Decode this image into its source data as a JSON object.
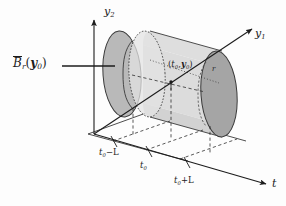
{
  "figure": {
    "kind": "3d-cylinder-diagram",
    "background_color": "#fdfdfd",
    "ink_color": "#1c1c1c"
  },
  "axes": {
    "vertical": {
      "name": "y2-axis",
      "label_base": "y",
      "label_sub": "2"
    },
    "depth": {
      "name": "y1-axis",
      "label_base": "y",
      "label_sub": "1"
    },
    "horizontal": {
      "name": "t-axis",
      "label_base": "t",
      "label_sub": ""
    }
  },
  "ticks": [
    {
      "label_lead": "t",
      "label_sub": "0",
      "label_tail": "−L"
    },
    {
      "label_lead": "t",
      "label_sub": "0",
      "label_tail": ""
    },
    {
      "label_lead": "t",
      "label_sub": "0",
      "label_tail": "+L"
    }
  ],
  "annotations": {
    "ball_label": {
      "overline_base": "B",
      "overline_sub": "r",
      "arg_open": "(",
      "arg_y": "y",
      "arg_sub": "0",
      "arg_close": ")"
    },
    "center_point": {
      "open": "(",
      "t": "t",
      "t_sub": "0",
      "comma": ",",
      "y": "y",
      "y_sub": "0",
      "close": ")"
    },
    "radius": "r"
  },
  "colors": {
    "left_disk_fill": "#b9b9b9",
    "right_disk_fill": "#a3a3a3",
    "body_fill": "#d6d6d6",
    "body_fill_light": "#e4e4e4",
    "stroke": "#3a3a3a",
    "dash": "#2e2e2e"
  }
}
